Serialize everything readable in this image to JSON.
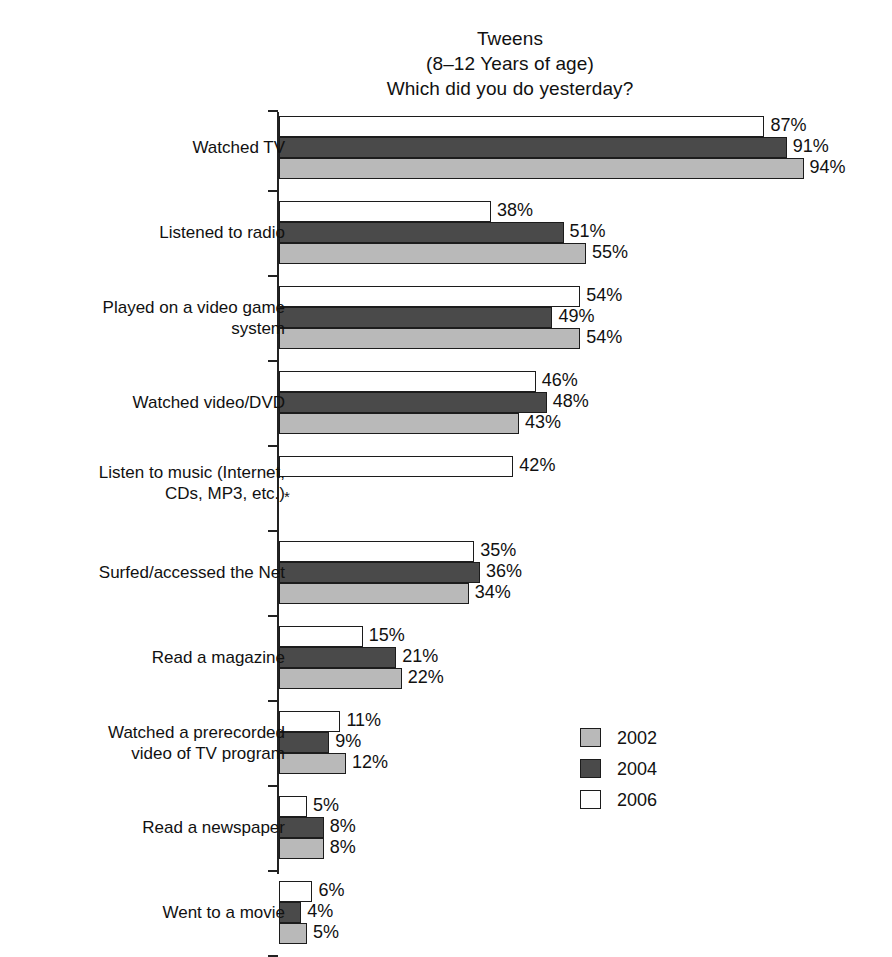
{
  "title": {
    "line1": "Tweens",
    "line2": "(8–12 Years of age)",
    "line3": "Which did you do yesterday?"
  },
  "footnote_marker": "*",
  "legend": {
    "position": "bottom-right",
    "items": [
      {
        "label": "2002",
        "color": "#b9b9b9"
      },
      {
        "label": "2004",
        "color": "#4a4a4a"
      },
      {
        "label": "2006",
        "color": "#ffffff"
      }
    ]
  },
  "chart_data": {
    "type": "bar",
    "orientation": "horizontal",
    "xlabel": "",
    "ylabel": "",
    "xlim": [
      0,
      100
    ],
    "grid": false,
    "value_suffix": "%",
    "categories": [
      "Watched TV",
      "Listened to radio",
      "Played on a video game\nsystem",
      "Watched video/DVD",
      "Listen to music (Internet,\nCDs, MP3, etc.)",
      "Surfed/accessed the Net",
      "Read a magazine",
      "Watched a prerecorded\nvideo of TV program",
      "Read a newspaper",
      "Went to a movie"
    ],
    "series": [
      {
        "name": "2006",
        "color": "#ffffff",
        "values": [
          87,
          38,
          54,
          46,
          42,
          35,
          15,
          11,
          5,
          6
        ],
        "labels": [
          "87%",
          "38%",
          "54%",
          "46%",
          "42%",
          "35%",
          "15%",
          "11%",
          "5%",
          "6%"
        ]
      },
      {
        "name": "2004",
        "color": "#4a4a4a",
        "values": [
          91,
          51,
          49,
          48,
          null,
          36,
          21,
          9,
          8,
          4
        ],
        "labels": [
          "91%",
          "51%",
          "49%",
          "48%",
          "",
          "36%",
          "21%",
          "9%",
          "8%",
          "4%"
        ]
      },
      {
        "name": "2002",
        "color": "#b9b9b9",
        "values": [
          94,
          55,
          54,
          43,
          null,
          34,
          22,
          12,
          8,
          5
        ],
        "labels": [
          "94%",
          "55%",
          "54%",
          "43%",
          "",
          "34%",
          "22%",
          "12%",
          "8%",
          "5%"
        ]
      }
    ]
  }
}
